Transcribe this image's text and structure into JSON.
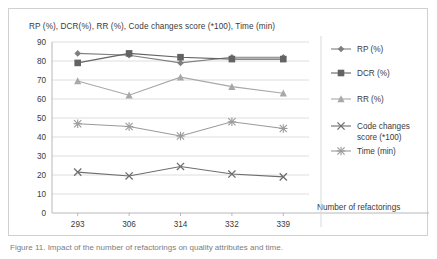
{
  "figure": {
    "caption": "Figure 11. Impact of the number of refactorings on quality attributes and time."
  },
  "chart_data": {
    "type": "line",
    "title": "RP (%), DCR(%), RR (%), Code changes score (*100), Time (min)",
    "xlabel": "Number of refactorings",
    "ylabel": "",
    "categories": [
      "293",
      "306",
      "314",
      "332",
      "339"
    ],
    "ylim": [
      0,
      90
    ],
    "yticks": [
      0,
      10,
      20,
      30,
      40,
      50,
      60,
      70,
      80,
      90
    ],
    "grid": true,
    "legend_position": "right",
    "series": [
      {
        "name": "RP (%)",
        "marker": "diamond",
        "color": "#7f7f7f",
        "values": [
          84,
          83,
          79,
          82,
          82
        ]
      },
      {
        "name": "DCR (%)",
        "marker": "square",
        "color": "#636363",
        "values": [
          79,
          84,
          82,
          81,
          81
        ]
      },
      {
        "name": "RR (%)",
        "marker": "triangle",
        "color": "#a8a8a8",
        "values": [
          69.5,
          62,
          71.5,
          66.5,
          63
        ]
      },
      {
        "name": "Code changes score (*100)",
        "marker": "x",
        "color": "#6e6e6e",
        "values": [
          21.5,
          19.5,
          24.5,
          20.5,
          19
        ]
      },
      {
        "name": "Time (min)",
        "marker": "asterisk",
        "color": "#9a9a9a",
        "values": [
          47,
          45.5,
          40.5,
          48,
          44.5
        ]
      }
    ]
  }
}
